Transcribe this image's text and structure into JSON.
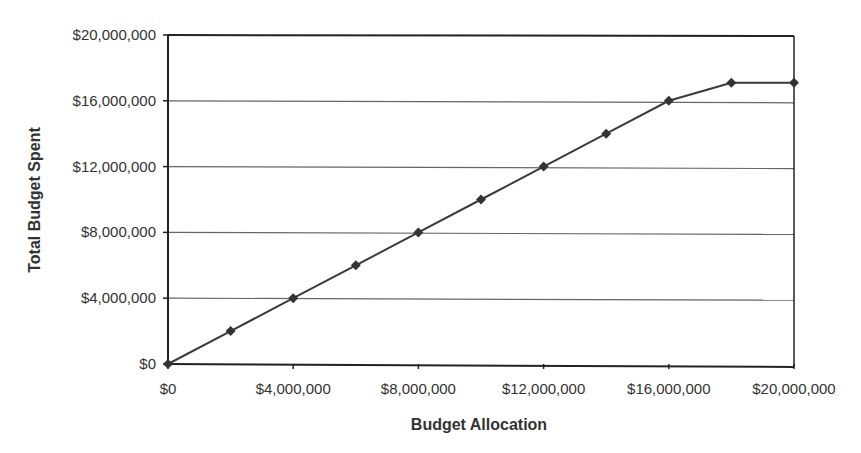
{
  "chart_data": {
    "type": "line",
    "title": "",
    "xlabel": "Budget Allocation",
    "ylabel": "Total Budget Spent",
    "xlim": [
      0,
      20000000
    ],
    "ylim": [
      0,
      20000000
    ],
    "x_ticks": [
      "$0",
      "$4,000,000",
      "$8,000,000",
      "$12,000,000",
      "$16,000,000",
      "$20,000,000"
    ],
    "y_ticks": [
      "$0",
      "$4,000,000",
      "$8,000,000",
      "$12,000,000",
      "$16,000,000",
      "$20,000,000"
    ],
    "grid": "horizontal",
    "legend": "none",
    "series": [
      {
        "name": "Total Budget Spent",
        "marker": "diamond",
        "x": [
          0,
          2000000,
          4000000,
          6000000,
          8000000,
          10000000,
          12000000,
          14000000,
          16000000,
          18000000,
          20000000
        ],
        "values": [
          0,
          2000000,
          4000000,
          6000000,
          8000000,
          10000000,
          12000000,
          14000000,
          16000000,
          17100000,
          17100000
        ]
      }
    ]
  },
  "colors": {
    "line": "#3a3a3a",
    "marker": "#333333",
    "grid": "#666666",
    "axis": "#222222"
  }
}
